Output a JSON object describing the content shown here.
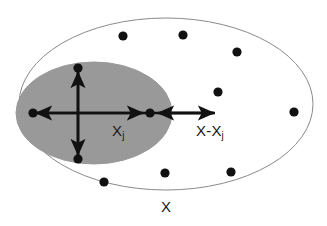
{
  "figure": {
    "type": "set-diagram",
    "background": "#ffffff",
    "width": 327,
    "height": 226
  },
  "colors": {
    "outer_ellipse_stroke": "#8a8a8a",
    "outer_ellipse_fill": "#ffffff",
    "inner_ellipse_fill": "#999999",
    "inner_ellipse_stroke": "#999999",
    "dot": "#111111",
    "arrow": "#111111",
    "label_text": "#1a1a1a"
  },
  "labels": {
    "inner_set": {
      "text": "X",
      "subscript": "j",
      "x": 112,
      "y": 123
    },
    "difference_set": {
      "text": "X-X",
      "subscript": "j",
      "x": 196,
      "y": 123
    },
    "outer_set": {
      "text": "X",
      "subscript": "",
      "x": 161,
      "y": 199
    }
  },
  "shapes": {
    "outer_ellipse": {
      "cx": 166,
      "cy": 104,
      "rx": 147,
      "ry": 86,
      "stroke_width": 1
    },
    "inner_ellipse": {
      "cx": 94,
      "cy": 113,
      "rx": 78,
      "ry": 51
    }
  },
  "axes": {
    "horizontal_y": 113,
    "vertical_x": 78,
    "stroke_width": 2.6
  },
  "arrows": [
    {
      "name": "inner-left-arrow",
      "x1": 78,
      "y1": 113,
      "x2": 36,
      "y2": 113,
      "label": "radius left"
    },
    {
      "name": "inner-right-arrow",
      "x1": 78,
      "y1": 113,
      "x2": 143,
      "y2": 113,
      "label": "radius right"
    },
    {
      "name": "inner-up-arrow",
      "x1": 78,
      "y1": 113,
      "x2": 78,
      "y2": 72,
      "label": "radius up"
    },
    {
      "name": "inner-down-arrow",
      "x1": 78,
      "y1": 113,
      "x2": 78,
      "y2": 155,
      "label": "radius down"
    },
    {
      "name": "difference-left-arrow",
      "x1": 213,
      "y1": 113,
      "x2": 158,
      "y2": 113,
      "label": "X-Xj left"
    },
    {
      "name": "difference-right-arrow",
      "x1": 160,
      "y1": 113,
      "x2": 214,
      "y2": 113,
      "label": "X-Xj right"
    }
  ],
  "points": [
    {
      "name": "point-inner-left",
      "cx": 33,
      "cy": 113,
      "r": 4.6,
      "region": "inner"
    },
    {
      "name": "point-inner-top",
      "cx": 78,
      "cy": 68,
      "r": 4.6,
      "region": "inner"
    },
    {
      "name": "point-inner-bottom",
      "cx": 78,
      "cy": 159,
      "r": 4.6,
      "region": "inner"
    },
    {
      "name": "point-center-xj",
      "cx": 150,
      "cy": 113,
      "r": 4.6,
      "region": "inner"
    },
    {
      "name": "point-outer-1",
      "cx": 123,
      "cy": 36,
      "r": 4.6,
      "region": "outer"
    },
    {
      "name": "point-outer-2",
      "cx": 183,
      "cy": 35,
      "r": 4.6,
      "region": "outer"
    },
    {
      "name": "point-outer-3",
      "cx": 237,
      "cy": 52,
      "r": 4.6,
      "region": "outer"
    },
    {
      "name": "point-outer-4",
      "cx": 218,
      "cy": 92,
      "r": 4.6,
      "region": "outer"
    },
    {
      "name": "point-outer-5",
      "cx": 294,
      "cy": 112,
      "r": 4.6,
      "region": "outer"
    },
    {
      "name": "point-outer-6",
      "cx": 104,
      "cy": 182,
      "r": 4.6,
      "region": "outer"
    },
    {
      "name": "point-outer-7",
      "cx": 165,
      "cy": 173,
      "r": 4.6,
      "region": "outer"
    },
    {
      "name": "point-outer-8",
      "cx": 231,
      "cy": 172,
      "r": 4.6,
      "region": "outer"
    }
  ]
}
